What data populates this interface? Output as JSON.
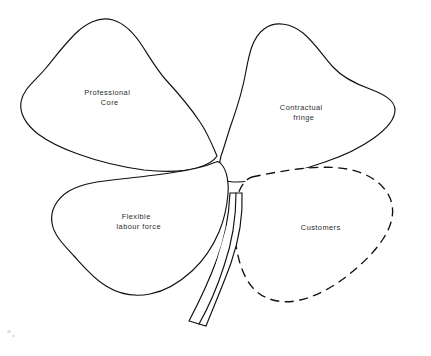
{
  "figure": {
    "background_color": "#ffffff",
    "ink_color": "#111111",
    "label_color": "#2b2b2b"
  },
  "leaves": [
    {
      "id": "professional-core",
      "label_line1": "Professional",
      "label_line2": "Core",
      "outline_style": "solid",
      "position": "top-left",
      "label_x": 116,
      "label_y": 93
    },
    {
      "id": "contractual-fringe",
      "label_line1": "Contractual",
      "label_line2": "fringe",
      "outline_style": "solid",
      "position": "top-right",
      "label_x": 310,
      "label_y": 108
    },
    {
      "id": "flexible-labour-force",
      "label_line1": "Flexible",
      "label_line2": "labour force",
      "outline_style": "solid",
      "position": "bottom-left",
      "label_x": 145,
      "label_y": 217
    },
    {
      "id": "customers",
      "label_line1": "Customers",
      "label_line2": "",
      "outline_style": "dashed",
      "position": "bottom-right",
      "label_x": 327,
      "label_y": 228
    }
  ],
  "stem": {
    "id": "stem",
    "outline_style": "solid"
  }
}
